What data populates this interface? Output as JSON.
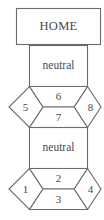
{
  "diagram": {
    "title_node": {
      "label": "HOME"
    },
    "neutral_upper": {
      "label": "neutral"
    },
    "neutral_lower": {
      "label": "neutral"
    },
    "upper_cluster": {
      "left_diamond": "5",
      "top_cell": "6",
      "bottom_cell": "7",
      "right_diamond": "8"
    },
    "lower_cluster": {
      "left_diamond": "1",
      "top_cell": "2",
      "bottom_cell": "3",
      "right_diamond": "4"
    }
  },
  "colors": {
    "stroke": "#6b6b6b",
    "text": "#4a4a4a",
    "background": "#ffffff"
  }
}
